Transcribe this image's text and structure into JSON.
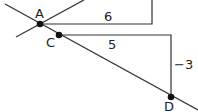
{
  "diagram": {
    "points": [
      {
        "id": "A",
        "label": "A",
        "x": 40,
        "y": 24
      },
      {
        "id": "C",
        "label": "C",
        "x": 59,
        "y": 35
      },
      {
        "id": "D",
        "label": "D",
        "x": 171,
        "y": 97
      }
    ],
    "triangle_upper": {
      "run_label": "6"
    },
    "triangle_lower": {
      "run_label": "5",
      "rise_label": "−3"
    },
    "colors": {
      "line": "#333333",
      "point": "#111111",
      "background": "#ffffff"
    }
  }
}
